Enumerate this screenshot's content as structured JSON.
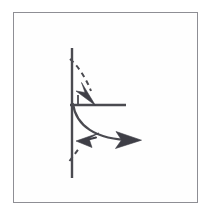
{
  "figure": {
    "kind": "vector-mechanics-diagram",
    "caption": "",
    "background_color": "#fefefe",
    "frame": {
      "name": "figure-border",
      "color": "#8e8e94",
      "x": 13,
      "y": 12,
      "width": 185,
      "height": 191,
      "stroke_width": 1
    },
    "stroke_color": "#4a4a50",
    "fill_color": "#3e3e46",
    "elements": {
      "vertical_axis": {
        "label": "vertical-axis-line",
        "x1": 72,
        "y1": 48,
        "x2": 72,
        "y2": 178,
        "stroke_width": 2.4,
        "style": "solid"
      },
      "horizontal_axis": {
        "label": "horizontal-axis-line",
        "x1": 70,
        "y1": 105,
        "x2": 126,
        "y2": 105,
        "stroke_width": 2.4,
        "style": "solid"
      },
      "right_angle_tick": {
        "label": "right-angle-tick-mark",
        "x1": 78,
        "y1": 95,
        "x2": 78,
        "y2": 105,
        "stroke_width": 1.8,
        "style": "solid"
      },
      "solid_curve": {
        "label": "solid-curved-arrow",
        "path": "M 73 104 C 76 124 94 140 134 140",
        "stroke_width": 2.2,
        "style": "solid",
        "arrow_tip": {
          "x": 141,
          "y": 140
        },
        "arrow_direction": "right"
      },
      "dashed_curve_upper": {
        "label": "dashed-curved-arrow-upper",
        "path": "M 70 59 C 78 66 86 78 92 92",
        "stroke_width": 2.0,
        "style": "dashed",
        "dash_pattern": "5 4",
        "arrow_tip": {
          "x": 95,
          "y": 104
        },
        "arrow_direction": "down-right"
      },
      "dashed_segment_lower": {
        "label": "dashed-segment-lower",
        "path": "M 70 160 L 80 147",
        "stroke_width": 2.0,
        "style": "dashed",
        "dash_pattern": "5 4"
      },
      "arrowhead_upleft": {
        "label": "arrowhead-up-left",
        "tip": {
          "x": 77,
          "y": 142
        },
        "direction": "up-left",
        "on": "solid-curve"
      }
    }
  }
}
